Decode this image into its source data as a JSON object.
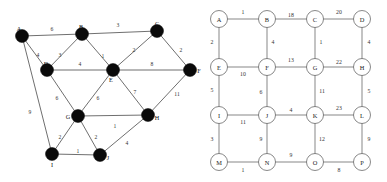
{
  "figure": {
    "title": ""
  },
  "chart_data": {
    "type": "diagram",
    "subtype": "weighted-undirected-graphs",
    "title": "",
    "panels": [
      {
        "id": "left-graph",
        "name": "Irregular weighted graph",
        "node_style": "filled-black-disc",
        "nodes": [
          {
            "id": "A",
            "label": "A",
            "x": 22,
            "y": 36,
            "label_dx": -3,
            "label_dy": -8
          },
          {
            "id": "B",
            "label": "B",
            "x": 82,
            "y": 34,
            "label_dx": -1,
            "label_dy": -8
          },
          {
            "id": "C",
            "label": "C",
            "x": 157,
            "y": 31,
            "label_dx": 0,
            "label_dy": -8
          },
          {
            "id": "D",
            "label": "D",
            "x": 47,
            "y": 70,
            "label_dx": -1,
            "label_dy": -7
          },
          {
            "id": "E",
            "label": "E",
            "x": 113,
            "y": 70,
            "label_dx": -2,
            "label_dy": 9
          },
          {
            "id": "F",
            "label": "F",
            "x": 190,
            "y": 70,
            "label_dx": 9,
            "label_dy": 0
          },
          {
            "id": "G",
            "label": "G",
            "x": 78,
            "y": 116,
            "label_dx": -10,
            "label_dy": 0
          },
          {
            "id": "H",
            "label": "H",
            "x": 148,
            "y": 115,
            "label_dx": 9,
            "label_dy": 2
          },
          {
            "id": "I",
            "label": "I",
            "x": 52,
            "y": 154,
            "label_dx": 0,
            "label_dy": 10
          },
          {
            "id": "J",
            "label": "J",
            "x": 100,
            "y": 155,
            "label_dx": 8,
            "label_dy": 2
          }
        ],
        "node_radius": 6.5,
        "edges": [
          {
            "from": "A",
            "to": "B",
            "weight": "6",
            "lx": 52,
            "ly": 29
          },
          {
            "from": "B",
            "to": "C",
            "weight": "3",
            "lx": 118,
            "ly": 25
          },
          {
            "from": "A",
            "to": "D",
            "weight": "4",
            "lx": 38,
            "ly": 55
          },
          {
            "from": "B",
            "to": "D",
            "weight": "3",
            "lx": 60,
            "ly": 55
          },
          {
            "from": "B",
            "to": "E",
            "weight": "1",
            "lx": 103,
            "ly": 56
          },
          {
            "from": "C",
            "to": "E",
            "weight": "2",
            "lx": 134,
            "ly": 50
          },
          {
            "from": "C",
            "to": "F",
            "weight": "2",
            "lx": 181,
            "ly": 50
          },
          {
            "from": "D",
            "to": "E",
            "weight": "4",
            "lx": 80,
            "ly": 64
          },
          {
            "from": "E",
            "to": "F",
            "weight": "8",
            "lx": 152,
            "ly": 64
          },
          {
            "from": "D",
            "to": "G",
            "weight": "6",
            "lx": 57,
            "ly": 98
          },
          {
            "from": "E",
            "to": "G",
            "weight": "6",
            "lx": 98,
            "ly": 98
          },
          {
            "from": "E",
            "to": "H",
            "weight": "7",
            "lx": 135,
            "ly": 92
          },
          {
            "from": "F",
            "to": "H",
            "weight": "11",
            "lx": 177,
            "ly": 94
          },
          {
            "from": "G",
            "to": "H",
            "weight": "1",
            "lx": 115,
            "ly": 126
          },
          {
            "from": "A",
            "to": "I",
            "weight": "9",
            "lx": 30,
            "ly": 112
          },
          {
            "from": "G",
            "to": "I",
            "weight": "2",
            "lx": 60,
            "ly": 137
          },
          {
            "from": "G",
            "to": "J",
            "weight": "2",
            "lx": 96,
            "ly": 137
          },
          {
            "from": "I",
            "to": "J",
            "weight": "1",
            "lx": 78,
            "ly": 151
          },
          {
            "from": "J",
            "to": "H",
            "weight": "4",
            "lx": 127,
            "ly": 143
          }
        ]
      },
      {
        "id": "right-graph",
        "name": "4x4 grid weighted graph",
        "node_style": "open-circle",
        "nodes": [
          {
            "id": "A",
            "label": "A",
            "x": 219,
            "y": 19
          },
          {
            "id": "B",
            "label": "B",
            "x": 267,
            "y": 19
          },
          {
            "id": "C",
            "label": "C",
            "x": 315,
            "y": 19
          },
          {
            "id": "D",
            "label": "D",
            "x": 362,
            "y": 19
          },
          {
            "id": "E",
            "label": "E",
            "x": 219,
            "y": 67
          },
          {
            "id": "F",
            "label": "F",
            "x": 267,
            "y": 67
          },
          {
            "id": "G",
            "label": "G",
            "x": 315,
            "y": 67
          },
          {
            "id": "H",
            "label": "H",
            "x": 362,
            "y": 67
          },
          {
            "id": "I",
            "label": "I",
            "x": 219,
            "y": 115
          },
          {
            "id": "J",
            "label": "J",
            "x": 267,
            "y": 115
          },
          {
            "id": "K",
            "label": "K",
            "x": 315,
            "y": 115
          },
          {
            "id": "L",
            "label": "L",
            "x": 362,
            "y": 115
          },
          {
            "id": "M",
            "label": "M",
            "x": 219,
            "y": 162
          },
          {
            "id": "N",
            "label": "N",
            "x": 267,
            "y": 162
          },
          {
            "id": "O",
            "label": "O",
            "x": 315,
            "y": 162
          },
          {
            "id": "P",
            "label": "P",
            "x": 362,
            "y": 162
          }
        ],
        "node_radius": 8.5,
        "edges": [
          {
            "from": "A",
            "to": "B",
            "weight": "1",
            "lx": 243,
            "ly": 12
          },
          {
            "from": "B",
            "to": "C",
            "weight": "18",
            "lx": 291,
            "ly": 15
          },
          {
            "from": "C",
            "to": "D",
            "weight": "20",
            "lx": 339,
            "ly": 12
          },
          {
            "from": "A",
            "to": "E",
            "weight": "2",
            "lx": 212,
            "ly": 42
          },
          {
            "from": "B",
            "to": "F",
            "weight": "4",
            "lx": 273,
            "ly": 42
          },
          {
            "from": "C",
            "to": "G",
            "weight": "1",
            "lx": 321,
            "ly": 42
          },
          {
            "from": "D",
            "to": "H",
            "weight": "4",
            "lx": 369,
            "ly": 42
          },
          {
            "from": "E",
            "to": "F",
            "weight": "10",
            "lx": 243,
            "ly": 74
          },
          {
            "from": "F",
            "to": "G",
            "weight": "13",
            "lx": 291,
            "ly": 60
          },
          {
            "from": "G",
            "to": "H",
            "weight": "22",
            "lx": 339,
            "ly": 62
          },
          {
            "from": "E",
            "to": "I",
            "weight": "5",
            "lx": 212,
            "ly": 90
          },
          {
            "from": "F",
            "to": "J",
            "weight": "6",
            "lx": 261,
            "ly": 92
          },
          {
            "from": "G",
            "to": "K",
            "weight": "11",
            "lx": 322,
            "ly": 91
          },
          {
            "from": "H",
            "to": "L",
            "weight": "5",
            "lx": 369,
            "ly": 91
          },
          {
            "from": "I",
            "to": "J",
            "weight": "11",
            "lx": 243,
            "ly": 122
          },
          {
            "from": "J",
            "to": "K",
            "weight": "4",
            "lx": 291,
            "ly": 110
          },
          {
            "from": "K",
            "to": "L",
            "weight": "23",
            "lx": 339,
            "ly": 108
          },
          {
            "from": "I",
            "to": "M",
            "weight": "3",
            "lx": 212,
            "ly": 139
          },
          {
            "from": "J",
            "to": "N",
            "weight": "9",
            "lx": 261,
            "ly": 139
          },
          {
            "from": "K",
            "to": "O",
            "weight": "12",
            "lx": 322,
            "ly": 139
          },
          {
            "from": "L",
            "to": "P",
            "weight": "9",
            "lx": 369,
            "ly": 139
          },
          {
            "from": "M",
            "to": "N",
            "weight": "1",
            "lx": 243,
            "ly": 170
          },
          {
            "from": "N",
            "to": "O",
            "weight": "9",
            "lx": 291,
            "ly": 155
          },
          {
            "from": "O",
            "to": "P",
            "weight": "8",
            "lx": 339,
            "ly": 170
          }
        ]
      }
    ]
  },
  "colors": {
    "background": "#ffffff",
    "node_fill_left": "#0a0a0a",
    "node_fill_right": "#ffffff",
    "node_stroke": "#555555",
    "edge_stroke": "#4a4a4a",
    "text": "#222222"
  }
}
